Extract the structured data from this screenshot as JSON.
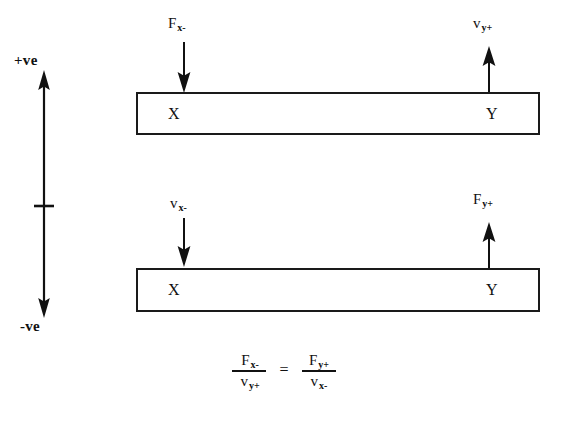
{
  "diagram": {
    "sign_axis": {
      "positive_label": "+ve",
      "negative_label": "-ve",
      "tick_present": true
    },
    "beams": [
      {
        "id": "top",
        "left_node": "X",
        "right_node": "Y",
        "left_vector": {
          "symbol": "F",
          "subscript": "x-",
          "direction": "down"
        },
        "right_vector": {
          "symbol": "v",
          "subscript": "y+",
          "direction": "up"
        }
      },
      {
        "id": "bottom",
        "left_node": "X",
        "right_node": "Y",
        "left_vector": {
          "symbol": "v",
          "subscript": "x-",
          "direction": "down"
        },
        "right_vector": {
          "symbol": "F",
          "subscript": "y+",
          "direction": "up"
        }
      }
    ],
    "equation": {
      "left_numerator_symbol": "F",
      "left_numerator_subscript": "x-",
      "left_denominator_symbol": "v",
      "left_denominator_subscript": "y+",
      "equals": "=",
      "right_numerator_symbol": "F",
      "right_numerator_subscript": "y+",
      "right_denominator_symbol": "v",
      "right_denominator_subscript": "x-"
    },
    "colors": {
      "ink": "#111111",
      "background": "#ffffff"
    }
  }
}
